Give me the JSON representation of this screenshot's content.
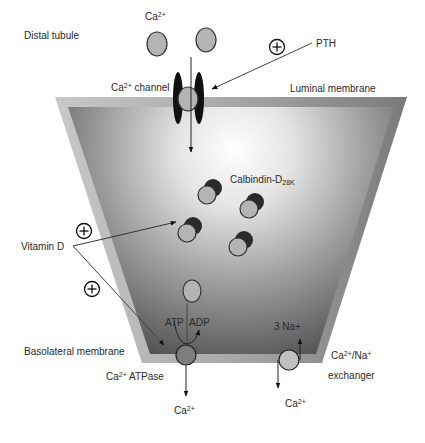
{
  "labels": {
    "distal_tubule": "Distal tubule",
    "ca_top": "Ca",
    "ca_top_sup": "2+",
    "pth": "PTH",
    "ca_channel": "Ca",
    "ca_channel_sup": "2+",
    "ca_channel_rest": " channel",
    "luminal_membrane": "Luminal membrane",
    "calbindin": "Calbindin-D",
    "calbindin_sub": "28K",
    "vitamin_d": "Vitamin D",
    "atp": "ATP",
    "adp": "ADP",
    "three_na": "3 Na+",
    "basolateral_membrane": "Basolateral membrane",
    "ca_atpase": "Ca",
    "ca_atpase_sup": "2+",
    "ca_atpase_rest": " ATPase",
    "exchanger_line1": "Ca",
    "exchanger_line1_sup": "2+",
    "exchanger_line1_rest": "/Na",
    "exchanger_line1_sup2": "+",
    "exchanger_line2": "exchanger",
    "ca_bottom_left": "Ca",
    "ca_bottom_left_sup": "2+",
    "ca_bottom_right": "Ca",
    "ca_bottom_right_sup": "2+"
  },
  "symbols": {
    "plus_pth": "+",
    "plus_vitd_upper": "+",
    "plus_vitd_lower": "+"
  },
  "colors": {
    "ion_fill": "#b4b4b4",
    "ion_stroke": "#333333",
    "channel": "#111111",
    "membrane_outer": "#9a9a9a",
    "cell_dark": "#555555",
    "cell_light": "#ffffff"
  }
}
